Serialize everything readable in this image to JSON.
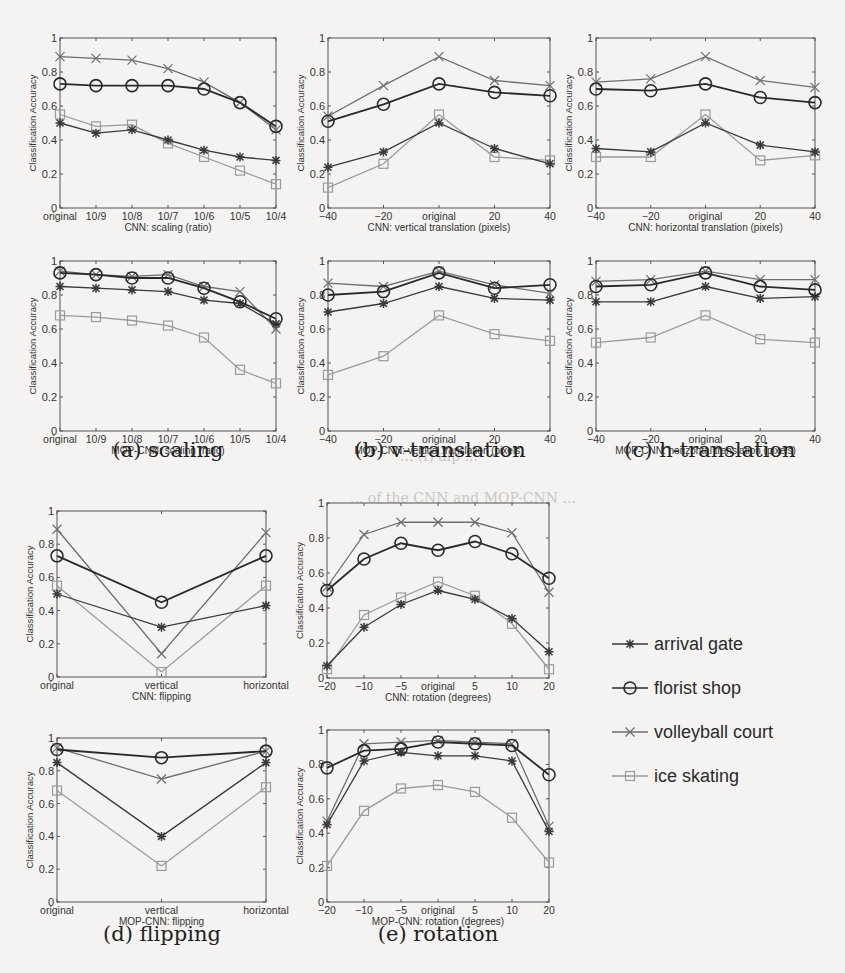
{
  "figure": {
    "y_axis_label": "Classification Accuracy",
    "captions": {
      "a": "(a) scaling",
      "b": "(b) v-translation",
      "c": "(c) h-translation",
      "d": "(d) flipping",
      "e": "(e) rotation"
    },
    "background_text": [
      "... (f) alp ...",
      "... of the CNN and MOP-CNN ..."
    ],
    "legend": [
      {
        "name": "arrival gate",
        "marker": "asterisk",
        "color": "#3a3a3a"
      },
      {
        "name": "florist shop",
        "marker": "circle",
        "color": "#2a2a2a"
      },
      {
        "name": "volleyball court",
        "marker": "x",
        "color": "#6e6e6e"
      },
      {
        "name": "ice skating",
        "marker": "square",
        "color": "#9a9a9a"
      }
    ]
  },
  "chart_data": [
    {
      "id": "cnn-scaling",
      "type": "line",
      "frame": [
        60,
        38,
        276,
        208
      ],
      "xlabel": "CNN: scaling (ratio)",
      "ylabel": "Classification Accuracy",
      "categories": [
        "original",
        "10/9",
        "10/8",
        "10/7",
        "10/6",
        "10/5",
        "10/4"
      ],
      "ylim": [
        0,
        1
      ],
      "yticks": [
        0,
        0.2,
        0.4,
        0.6,
        0.8,
        1
      ],
      "series": [
        {
          "name": "arrival gate",
          "values": [
            0.5,
            0.44,
            0.46,
            0.4,
            0.34,
            0.3,
            0.28
          ]
        },
        {
          "name": "florist shop",
          "values": [
            0.73,
            0.72,
            0.72,
            0.72,
            0.7,
            0.62,
            0.48
          ]
        },
        {
          "name": "volleyball court",
          "values": [
            0.89,
            0.88,
            0.87,
            0.82,
            0.74,
            0.62,
            0.46
          ]
        },
        {
          "name": "ice skating",
          "values": [
            0.55,
            0.48,
            0.49,
            0.38,
            0.3,
            0.22,
            0.14
          ]
        }
      ]
    },
    {
      "id": "cnn-vtrans",
      "type": "line",
      "frame": [
        328,
        38,
        550,
        208
      ],
      "xlabel": "CNN: vertical translation (pixels)",
      "ylabel": "Classification Accuracy",
      "categories": [
        "-40",
        "-20",
        "original",
        "20",
        "40"
      ],
      "ylim": [
        0,
        1
      ],
      "yticks": [
        0,
        0.2,
        0.4,
        0.6,
        0.8,
        1
      ],
      "series": [
        {
          "name": "arrival gate",
          "values": [
            0.24,
            0.33,
            0.5,
            0.35,
            0.26
          ]
        },
        {
          "name": "florist shop",
          "values": [
            0.51,
            0.61,
            0.73,
            0.68,
            0.66
          ]
        },
        {
          "name": "volleyball court",
          "values": [
            0.54,
            0.72,
            0.89,
            0.75,
            0.72
          ]
        },
        {
          "name": "ice skating",
          "values": [
            0.12,
            0.26,
            0.55,
            0.3,
            0.28
          ]
        }
      ]
    },
    {
      "id": "cnn-htrans",
      "type": "line",
      "frame": [
        596,
        38,
        815,
        208
      ],
      "xlabel": "CNN: horizontal translation (pixels)",
      "ylabel": "Classification Accuracy",
      "categories": [
        "-40",
        "-20",
        "original",
        "20",
        "40"
      ],
      "ylim": [
        0,
        1
      ],
      "yticks": [
        0,
        0.2,
        0.4,
        0.6,
        0.8,
        1
      ],
      "series": [
        {
          "name": "arrival gate",
          "values": [
            0.35,
            0.33,
            0.5,
            0.37,
            0.33
          ]
        },
        {
          "name": "florist shop",
          "values": [
            0.7,
            0.69,
            0.73,
            0.65,
            0.62
          ]
        },
        {
          "name": "volleyball court",
          "values": [
            0.74,
            0.76,
            0.89,
            0.75,
            0.71
          ]
        },
        {
          "name": "ice skating",
          "values": [
            0.3,
            0.3,
            0.55,
            0.28,
            0.31
          ]
        }
      ]
    },
    {
      "id": "mop-scaling",
      "type": "line",
      "frame": [
        60,
        261,
        276,
        431
      ],
      "xlabel": "MOP-CNN: scaling (ratio)",
      "ylabel": "Classification Accuracy",
      "categories": [
        "original",
        "10/9",
        "10/8",
        "10/7",
        "10/6",
        "10/5",
        "10/4"
      ],
      "ylim": [
        0,
        1
      ],
      "yticks": [
        0,
        0.2,
        0.4,
        0.6,
        0.8,
        1
      ],
      "series": [
        {
          "name": "arrival gate",
          "values": [
            0.85,
            0.84,
            0.83,
            0.82,
            0.77,
            0.75,
            0.63
          ]
        },
        {
          "name": "florist shop",
          "values": [
            0.93,
            0.92,
            0.9,
            0.9,
            0.84,
            0.76,
            0.66
          ]
        },
        {
          "name": "volleyball court",
          "values": [
            0.94,
            0.92,
            0.91,
            0.92,
            0.85,
            0.82,
            0.6
          ]
        },
        {
          "name": "ice skating",
          "values": [
            0.68,
            0.67,
            0.65,
            0.62,
            0.55,
            0.36,
            0.28
          ]
        }
      ]
    },
    {
      "id": "mop-vtrans",
      "type": "line",
      "frame": [
        328,
        261,
        550,
        431
      ],
      "xlabel": "MOP-CNN: vertical translation (pixels)",
      "ylabel": "Classification Accuracy",
      "categories": [
        "-40",
        "-20",
        "original",
        "20",
        "40"
      ],
      "ylim": [
        0,
        1
      ],
      "yticks": [
        0,
        0.2,
        0.4,
        0.6,
        0.8,
        1
      ],
      "series": [
        {
          "name": "arrival gate",
          "values": [
            0.7,
            0.75,
            0.85,
            0.78,
            0.77
          ]
        },
        {
          "name": "florist shop",
          "values": [
            0.8,
            0.82,
            0.93,
            0.84,
            0.86
          ]
        },
        {
          "name": "volleyball court",
          "values": [
            0.87,
            0.85,
            0.94,
            0.86,
            0.81
          ]
        },
        {
          "name": "ice skating",
          "values": [
            0.33,
            0.44,
            0.68,
            0.57,
            0.53
          ]
        }
      ]
    },
    {
      "id": "mop-htrans",
      "type": "line",
      "frame": [
        596,
        261,
        815,
        431
      ],
      "xlabel": "MOP-CNN: horizontal translation (pixels)",
      "ylabel": "Classification Accuracy",
      "categories": [
        "-40",
        "-20",
        "original",
        "20",
        "40"
      ],
      "ylim": [
        0,
        1
      ],
      "yticks": [
        0,
        0.2,
        0.4,
        0.6,
        0.8,
        1
      ],
      "series": [
        {
          "name": "arrival gate",
          "values": [
            0.76,
            0.76,
            0.85,
            0.78,
            0.79
          ]
        },
        {
          "name": "florist shop",
          "values": [
            0.85,
            0.86,
            0.93,
            0.85,
            0.83
          ]
        },
        {
          "name": "volleyball court",
          "values": [
            0.88,
            0.89,
            0.94,
            0.89,
            0.89
          ]
        },
        {
          "name": "ice skating",
          "values": [
            0.52,
            0.55,
            0.68,
            0.54,
            0.52
          ]
        }
      ]
    },
    {
      "id": "cnn-flip",
      "type": "line",
      "frame": [
        57,
        511,
        266,
        677
      ],
      "xlabel": "CNN: flipping",
      "ylabel": "Classification Accuracy",
      "categories": [
        "original",
        "vertical",
        "horizontal"
      ],
      "ylim": [
        0,
        1
      ],
      "yticks": [
        0,
        0.2,
        0.4,
        0.6,
        0.8,
        1
      ],
      "series": [
        {
          "name": "arrival gate",
          "values": [
            0.5,
            0.3,
            0.43
          ]
        },
        {
          "name": "florist shop",
          "values": [
            0.73,
            0.45,
            0.73
          ]
        },
        {
          "name": "volleyball court",
          "values": [
            0.89,
            0.14,
            0.87
          ]
        },
        {
          "name": "ice skating",
          "values": [
            0.55,
            0.03,
            0.55
          ]
        }
      ]
    },
    {
      "id": "cnn-rot",
      "type": "line",
      "frame": [
        327,
        503,
        549,
        678
      ],
      "xlabel": "CNN: rotation (degrees)",
      "ylabel": "Classification Accuracy",
      "categories": [
        "-20",
        "-10",
        "-5",
        "original",
        "5",
        "10",
        "20"
      ],
      "ylim": [
        0,
        1
      ],
      "yticks": [
        0,
        0.2,
        0.4,
        0.6,
        0.8,
        1
      ],
      "series": [
        {
          "name": "arrival gate",
          "values": [
            0.07,
            0.29,
            0.42,
            0.5,
            0.45,
            0.34,
            0.15
          ]
        },
        {
          "name": "florist shop",
          "values": [
            0.5,
            0.68,
            0.77,
            0.73,
            0.78,
            0.71,
            0.57
          ]
        },
        {
          "name": "volleyball court",
          "values": [
            0.52,
            0.82,
            0.89,
            0.89,
            0.89,
            0.83,
            0.49
          ]
        },
        {
          "name": "ice skating",
          "values": [
            0.05,
            0.36,
            0.46,
            0.55,
            0.47,
            0.31,
            0.05
          ]
        }
      ]
    },
    {
      "id": "mop-flip",
      "type": "line",
      "frame": [
        57,
        738,
        266,
        902
      ],
      "xlabel": "MOP-CNN: flipping",
      "ylabel": "Classification Accuracy",
      "categories": [
        "original",
        "vertical",
        "horizontal"
      ],
      "ylim": [
        0,
        1
      ],
      "yticks": [
        0,
        0.2,
        0.4,
        0.6,
        0.8,
        1
      ],
      "series": [
        {
          "name": "arrival gate",
          "values": [
            0.85,
            0.4,
            0.85
          ]
        },
        {
          "name": "florist shop",
          "values": [
            0.93,
            0.88,
            0.92
          ]
        },
        {
          "name": "volleyball court",
          "values": [
            0.94,
            0.75,
            0.92
          ]
        },
        {
          "name": "ice skating",
          "values": [
            0.68,
            0.22,
            0.7
          ]
        }
      ]
    },
    {
      "id": "mop-rot",
      "type": "line",
      "frame": [
        327,
        730,
        549,
        902
      ],
      "xlabel": "MOP-CNN: rotation (degrees)",
      "ylabel": "Classification Accuracy",
      "categories": [
        "-20",
        "-10",
        "-5",
        "original",
        "5",
        "10",
        "20"
      ],
      "ylim": [
        0,
        1
      ],
      "yticks": [
        0,
        0.2,
        0.4,
        0.6,
        0.8,
        1
      ],
      "series": [
        {
          "name": "arrival gate",
          "values": [
            0.45,
            0.82,
            0.87,
            0.85,
            0.85,
            0.82,
            0.41
          ]
        },
        {
          "name": "florist shop",
          "values": [
            0.78,
            0.88,
            0.89,
            0.93,
            0.92,
            0.91,
            0.74
          ]
        },
        {
          "name": "volleyball court",
          "values": [
            0.47,
            0.92,
            0.93,
            0.94,
            0.93,
            0.92,
            0.44
          ]
        },
        {
          "name": "ice skating",
          "values": [
            0.21,
            0.53,
            0.66,
            0.68,
            0.64,
            0.49,
            0.23
          ]
        }
      ]
    }
  ]
}
